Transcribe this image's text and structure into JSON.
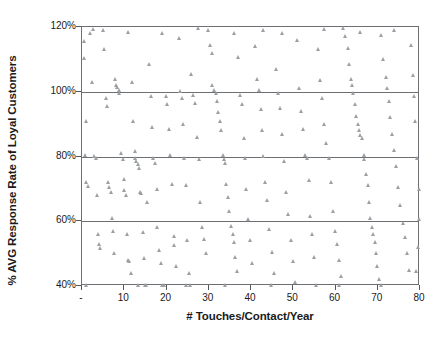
{
  "chart_data": {
    "type": "scatter",
    "title": "",
    "xlabel": "# Touches/Contact/Year",
    "ylabel": "% AVG Response Rate of Loyal Customers",
    "xlim": [
      0,
      80
    ],
    "ylim": [
      40,
      120
    ],
    "grid": true,
    "legend": null,
    "marker": "triangle",
    "marker_color": "#9ba0a3",
    "axis_color": "#6d6f72",
    "xticks": [
      0,
      10,
      20,
      30,
      40,
      50,
      60,
      70,
      80
    ],
    "xtick_labels": [
      "-",
      "10",
      "20",
      "30",
      "40",
      "50",
      "60",
      "70",
      "80"
    ],
    "yticks": [
      40,
      60,
      80,
      100,
      120
    ],
    "ytick_labels": [
      "40%",
      "60%",
      "80%",
      "100%",
      "120%"
    ],
    "gridlines_y": [
      60,
      80,
      100
    ],
    "points": [
      [
        0.5,
        115.5
      ],
      [
        0.7,
        110.2
      ],
      [
        1.0,
        91.0
      ],
      [
        0.8,
        80.5
      ],
      [
        1.2,
        72.0
      ],
      [
        1.5,
        70.8
      ],
      [
        1.0,
        40.3
      ],
      [
        2.0,
        118.0
      ],
      [
        2.5,
        102.8
      ],
      [
        3.0,
        80.2
      ],
      [
        3.4,
        79.4
      ],
      [
        3.8,
        68.0
      ],
      [
        4.0,
        56.0
      ],
      [
        4.2,
        53.0
      ],
      [
        4.5,
        51.5
      ],
      [
        5.0,
        119.0
      ],
      [
        5.4,
        113.0
      ],
      [
        5.8,
        98.0
      ],
      [
        6.0,
        95.5
      ],
      [
        6.3,
        72.0
      ],
      [
        6.6,
        70.5
      ],
      [
        7.0,
        69.0
      ],
      [
        7.2,
        61.0
      ],
      [
        7.5,
        57.0
      ],
      [
        7.8,
        50.0
      ],
      [
        8.0,
        104.0
      ],
      [
        8.2,
        102.0
      ],
      [
        8.5,
        101.5
      ],
      [
        8.8,
        100.5
      ],
      [
        9.0,
        99.5
      ],
      [
        9.4,
        81.0
      ],
      [
        9.8,
        79.0
      ],
      [
        10.0,
        73.0
      ],
      [
        10.2,
        69.5
      ],
      [
        10.5,
        68.0
      ],
      [
        10.8,
        56.0
      ],
      [
        11.0,
        48.0
      ],
      [
        11.3,
        47.5
      ],
      [
        11.8,
        44.0
      ],
      [
        12.0,
        103.0
      ],
      [
        12.3,
        91.0
      ],
      [
        12.6,
        81.5
      ],
      [
        12.8,
        79.5
      ],
      [
        13.0,
        78.5
      ],
      [
        13.3,
        77.5
      ],
      [
        13.6,
        76.5
      ],
      [
        13.9,
        69.0
      ],
      [
        14.2,
        68.5
      ],
      [
        14.5,
        56.5
      ],
      [
        14.8,
        48.5
      ],
      [
        15.0,
        40.3
      ],
      [
        15.3,
        40.3
      ],
      [
        15.6,
        66.0
      ],
      [
        16.0,
        108.5
      ],
      [
        16.4,
        98.5
      ],
      [
        16.8,
        89.0
      ],
      [
        17.0,
        79.5
      ],
      [
        17.4,
        78.0
      ],
      [
        17.8,
        70.0
      ],
      [
        18.0,
        58.0
      ],
      [
        18.4,
        51.0
      ],
      [
        18.8,
        47.0
      ],
      [
        19.0,
        40.3
      ],
      [
        19.5,
        40.3
      ],
      [
        20.0,
        98.5
      ],
      [
        20.3,
        96.0
      ],
      [
        20.7,
        88.5
      ],
      [
        21.0,
        80.5
      ],
      [
        21.4,
        71.5
      ],
      [
        21.8,
        55.5
      ],
      [
        22.0,
        52.5
      ],
      [
        22.5,
        46.0
      ],
      [
        23.0,
        116.5
      ],
      [
        23.4,
        100.0
      ],
      [
        23.8,
        98.0
      ],
      [
        24.0,
        90.0
      ],
      [
        24.3,
        79.5
      ],
      [
        24.8,
        71.0
      ],
      [
        25.0,
        54.0
      ],
      [
        25.4,
        44.0
      ],
      [
        25.8,
        40.3
      ],
      [
        26.0,
        105.5
      ],
      [
        26.5,
        99.0
      ],
      [
        27.0,
        96.5
      ],
      [
        27.4,
        86.0
      ],
      [
        27.8,
        79.0
      ],
      [
        28.0,
        66.0
      ],
      [
        28.5,
        58.0
      ],
      [
        29.0,
        54.5
      ],
      [
        29.5,
        50.0
      ],
      [
        30.0,
        119.0
      ],
      [
        30.4,
        114.5
      ],
      [
        30.8,
        112.0
      ],
      [
        31.0,
        102.0
      ],
      [
        31.4,
        100.5
      ],
      [
        31.8,
        99.5
      ],
      [
        32.0,
        97.0
      ],
      [
        32.3,
        93.5
      ],
      [
        32.7,
        91.0
      ],
      [
        33.0,
        88.0
      ],
      [
        33.4,
        80.5
      ],
      [
        33.8,
        79.0
      ],
      [
        34.0,
        78.0
      ],
      [
        34.3,
        71.5
      ],
      [
        34.7,
        67.5
      ],
      [
        35.0,
        63.0
      ],
      [
        35.4,
        58.5
      ],
      [
        35.8,
        56.0
      ],
      [
        36.0,
        53.5
      ],
      [
        36.4,
        49.0
      ],
      [
        36.8,
        44.5
      ],
      [
        37.0,
        110.5
      ],
      [
        37.5,
        99.0
      ],
      [
        38.0,
        96.0
      ],
      [
        38.4,
        85.5
      ],
      [
        38.8,
        79.5
      ],
      [
        39.0,
        70.0
      ],
      [
        39.5,
        60.5
      ],
      [
        40.0,
        54.0
      ],
      [
        40.4,
        47.0
      ],
      [
        41.0,
        114.0
      ],
      [
        41.5,
        104.0
      ],
      [
        42.0,
        100.5
      ],
      [
        42.4,
        94.5
      ],
      [
        42.8,
        88.0
      ],
      [
        43.0,
        80.0
      ],
      [
        43.5,
        72.0
      ],
      [
        44.0,
        66.5
      ],
      [
        44.5,
        57.5
      ],
      [
        45.0,
        50.5
      ],
      [
        45.5,
        44.0
      ],
      [
        46.0,
        107.0
      ],
      [
        46.5,
        99.5
      ],
      [
        47.0,
        95.0
      ],
      [
        47.5,
        87.0
      ],
      [
        48.0,
        78.5
      ],
      [
        48.5,
        69.0
      ],
      [
        49.0,
        62.0
      ],
      [
        49.5,
        54.0
      ],
      [
        50.0,
        47.5
      ],
      [
        50.5,
        41.0
      ],
      [
        51.0,
        116.0
      ],
      [
        51.5,
        101.0
      ],
      [
        52.0,
        94.0
      ],
      [
        52.5,
        88.5
      ],
      [
        53.0,
        80.5
      ],
      [
        53.3,
        79.5
      ],
      [
        53.8,
        72.5
      ],
      [
        54.0,
        61.5
      ],
      [
        54.5,
        56.0
      ],
      [
        55.0,
        49.0
      ],
      [
        55.5,
        40.3
      ],
      [
        56.0,
        113.0
      ],
      [
        56.5,
        103.5
      ],
      [
        57.0,
        98.0
      ],
      [
        57.5,
        90.0
      ],
      [
        58.0,
        84.0
      ],
      [
        58.5,
        79.5
      ],
      [
        59.0,
        72.0
      ],
      [
        59.5,
        63.0
      ],
      [
        60.0,
        57.0
      ],
      [
        60.5,
        53.0
      ],
      [
        61.0,
        48.0
      ],
      [
        61.5,
        43.0
      ],
      [
        62.0,
        119.5
      ],
      [
        62.5,
        117.0
      ],
      [
        63.0,
        113.5
      ],
      [
        63.4,
        108.5
      ],
      [
        63.8,
        104.0
      ],
      [
        64.0,
        102.0
      ],
      [
        64.4,
        99.5
      ],
      [
        64.8,
        96.0
      ],
      [
        65.0,
        92.5
      ],
      [
        65.4,
        90.0
      ],
      [
        65.8,
        88.0
      ],
      [
        66.0,
        86.5
      ],
      [
        66.4,
        85.5
      ],
      [
        66.8,
        80.5
      ],
      [
        67.0,
        79.0
      ],
      [
        67.4,
        74.5
      ],
      [
        67.8,
        71.0
      ],
      [
        68.0,
        66.0
      ],
      [
        68.4,
        61.0
      ],
      [
        68.8,
        58.0
      ],
      [
        69.0,
        56.0
      ],
      [
        69.4,
        53.5
      ],
      [
        69.8,
        50.0
      ],
      [
        70.0,
        46.0
      ],
      [
        70.5,
        42.0
      ],
      [
        71.0,
        117.5
      ],
      [
        71.5,
        110.0
      ],
      [
        72.0,
        104.5
      ],
      [
        72.4,
        101.0
      ],
      [
        72.8,
        97.0
      ],
      [
        73.0,
        92.0
      ],
      [
        73.5,
        87.0
      ],
      [
        74.0,
        82.0
      ],
      [
        74.5,
        77.0
      ],
      [
        75.0,
        70.5
      ],
      [
        75.5,
        65.0
      ],
      [
        76.0,
        59.5
      ],
      [
        76.5,
        55.0
      ],
      [
        77.0,
        50.0
      ],
      [
        77.5,
        45.0
      ],
      [
        78.0,
        114.5
      ],
      [
        78.4,
        105.0
      ],
      [
        78.8,
        98.5
      ],
      [
        79.0,
        91.0
      ],
      [
        79.4,
        79.5
      ],
      [
        79.8,
        70.0
      ],
      [
        80.0,
        60.5
      ],
      [
        79.6,
        52.0
      ],
      [
        79.2,
        44.5
      ],
      [
        13.5,
        40.3
      ],
      [
        34.0,
        40.3
      ],
      [
        44.8,
        40.3
      ],
      [
        61.0,
        40.3
      ],
      [
        70.8,
        40.3
      ],
      [
        24.8,
        40.3
      ],
      [
        2.8,
        119.2
      ],
      [
        19.0,
        118.0
      ],
      [
        27.5,
        119.5
      ],
      [
        43.0,
        119.0
      ],
      [
        57.5,
        119.3
      ],
      [
        74.0,
        119.0
      ],
      [
        11.0,
        118.5
      ],
      [
        47.5,
        118.0
      ],
      [
        66.0,
        118.5
      ],
      [
        36.0,
        118.0
      ]
    ]
  }
}
